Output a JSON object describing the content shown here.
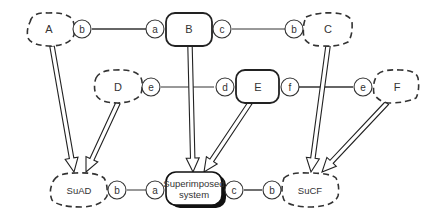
{
  "nodes": {
    "A": {
      "label": "A",
      "kind": "dashed"
    },
    "B": {
      "label": "B",
      "kind": "solid"
    },
    "C": {
      "label": "C",
      "kind": "dashed"
    },
    "D": {
      "label": "D",
      "kind": "dashed"
    },
    "E": {
      "label": "E",
      "kind": "solid"
    },
    "F": {
      "label": "F",
      "kind": "dashed"
    },
    "SuAD": {
      "label": "SuAD",
      "kind": "dashed"
    },
    "SuCF": {
      "label": "SuCF",
      "kind": "dashed"
    },
    "Super": {
      "label_line1": "Superimposed",
      "label_line2": "system",
      "kind": "solid-shadow"
    }
  },
  "ports": {
    "A_b": "b",
    "B_a": "a",
    "B_c": "c",
    "C_b": "b",
    "D_e": "e",
    "E_d": "d",
    "E_f": "f",
    "F_e": "e",
    "SuAD_b": "b",
    "Super_a": "a",
    "Super_c": "c",
    "SuCF_b": "b"
  },
  "connections": [
    {
      "from": "A.b",
      "to": "B.a"
    },
    {
      "from": "B.c",
      "to": "C.b"
    },
    {
      "from": "D.e",
      "to": "E.d"
    },
    {
      "from": "E.f",
      "to": "F.e"
    },
    {
      "from": "SuAD.b",
      "to": "Superimposed.a"
    },
    {
      "from": "Superimposed.c",
      "to": "SuCF.b"
    }
  ],
  "arrows": [
    {
      "from": "A",
      "to": "SuAD"
    },
    {
      "from": "D",
      "to": "SuAD"
    },
    {
      "from": "B",
      "to": "Superimposed system"
    },
    {
      "from": "E",
      "to": "Superimposed system"
    },
    {
      "from": "C",
      "to": "SuCF"
    },
    {
      "from": "F",
      "to": "SuCF"
    }
  ]
}
